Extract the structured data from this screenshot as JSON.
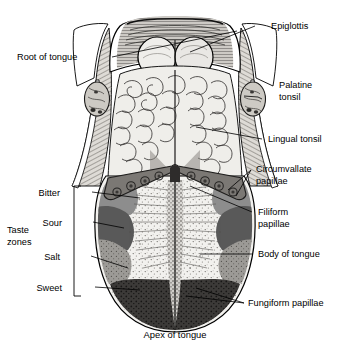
{
  "figure": {
    "caption": "Apex of tongue"
  },
  "labels": {
    "epiglottis": "Epiglottis",
    "root_of_tongue": "Root of tongue",
    "palatine_tonsil_l1": "Palatine",
    "palatine_tonsil_l2": "tonsil",
    "lingual_tonsil": "Lingual tonsil",
    "circumvallate_l1": "Circumvallate",
    "circumvallate_l2": "papillae",
    "filiform_l1": "Filiform",
    "filiform_l2": "papillae",
    "body_of_tongue": "Body of tongue",
    "fungiform": "Fungiform papillae",
    "taste_zones_l1": "Taste",
    "taste_zones_l2": "zones",
    "bitter": "Bitter",
    "sour": "Sour",
    "salt": "Salt",
    "sweet": "Sweet"
  },
  "taste_zones": [
    {
      "name": "Bitter",
      "region": "posterior",
      "tone": "#8d8d8d"
    },
    {
      "name": "Sour",
      "region": "posterior-lateral",
      "tone": "#595959"
    },
    {
      "name": "Salt",
      "region": "anterior-lateral",
      "tone": "#a8a8a8"
    },
    {
      "name": "Sweet",
      "region": "apex",
      "tone": "#3c3c3c"
    }
  ],
  "colors": {
    "ink": "#000000",
    "background": "#ffffff",
    "tissue_light": "#e8e6e2",
    "tissue_mid": "#bdbab4",
    "tissue_dark": "#6e6b66",
    "zone_bitter": "#8d8d8d",
    "zone_sour": "#595959",
    "zone_salt": "#a8a8a8",
    "zone_sweet": "#3c3c3c",
    "vallate_band": "#7b7874"
  },
  "anatomy_parts": [
    "Epiglottis",
    "Root of tongue",
    "Palatine tonsil",
    "Lingual tonsil",
    "Circumvallate papillae",
    "Filiform papillae",
    "Body of tongue",
    "Fungiform papillae",
    "Apex of tongue"
  ]
}
